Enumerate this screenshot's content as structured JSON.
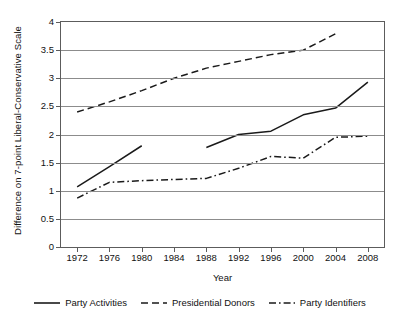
{
  "chart_data": {
    "type": "line",
    "title": "",
    "xlabel": "Year",
    "ylabel": "Difference on 7-point Liberal-Conservative Scale",
    "x": [
      1972,
      1976,
      1980,
      1984,
      1988,
      1992,
      1996,
      2000,
      2004,
      2008
    ],
    "xticklabels": [
      "1972",
      "1976",
      "1980",
      "1984",
      "1988",
      "1992",
      "1996",
      "2000",
      "2004",
      "2008"
    ],
    "yticklabels": [
      "0",
      "0.5",
      "1",
      "1.5",
      "2",
      "2.5",
      "3",
      "3.5",
      "4"
    ],
    "ytickvalues": [
      0,
      0.5,
      1,
      1.5,
      2,
      2.5,
      3,
      3.5,
      4
    ],
    "xlim": [
      1970,
      2010
    ],
    "ylim": [
      0,
      4
    ],
    "grid": "horizontal",
    "legend_position": "bottom",
    "series": [
      {
        "name": "Party Activities",
        "style": "solid",
        "color": "#1a1a1a",
        "points": [
          {
            "x": 1972,
            "y": 1.07
          },
          {
            "x": 1976,
            "y": 1.43
          },
          {
            "x": 1980,
            "y": 1.8
          },
          {
            "x": 1988,
            "y": 1.77
          },
          {
            "x": 1992,
            "y": 2.0
          },
          {
            "x": 1996,
            "y": 2.06
          },
          {
            "x": 2000,
            "y": 2.35
          },
          {
            "x": 2004,
            "y": 2.47
          },
          {
            "x": 2008,
            "y": 2.93
          }
        ],
        "gaps": [
          [
            1980,
            1988
          ]
        ]
      },
      {
        "name": "Presidential Donors",
        "style": "dashed",
        "color": "#1a1a1a",
        "points": [
          {
            "x": 1972,
            "y": 2.4
          },
          {
            "x": 1976,
            "y": 2.58
          },
          {
            "x": 1980,
            "y": 2.78
          },
          {
            "x": 1984,
            "y": 3.0
          },
          {
            "x": 1988,
            "y": 3.18
          },
          {
            "x": 1992,
            "y": 3.3
          },
          {
            "x": 1996,
            "y": 3.42
          },
          {
            "x": 2000,
            "y": 3.5
          },
          {
            "x": 2004,
            "y": 3.79
          }
        ],
        "gaps": []
      },
      {
        "name": "Party Identifiers",
        "style": "dash-dot",
        "color": "#1a1a1a",
        "points": [
          {
            "x": 1972,
            "y": 0.87
          },
          {
            "x": 1976,
            "y": 1.15
          },
          {
            "x": 1980,
            "y": 1.18
          },
          {
            "x": 1984,
            "y": 1.2
          },
          {
            "x": 1988,
            "y": 1.22
          },
          {
            "x": 1992,
            "y": 1.4
          },
          {
            "x": 1996,
            "y": 1.61
          },
          {
            "x": 2000,
            "y": 1.58
          },
          {
            "x": 2004,
            "y": 1.95
          },
          {
            "x": 2008,
            "y": 1.97
          }
        ],
        "gaps": []
      }
    ]
  },
  "legend": {
    "items": [
      {
        "label": "Party Activities",
        "style": "solid"
      },
      {
        "label": "Presidential Donors",
        "style": "dashed"
      },
      {
        "label": "Party Identifiers",
        "style": "dash-dot"
      }
    ]
  },
  "axes": {
    "x_title": "Year",
    "y_title": "Difference on 7-point Liberal-Conservative Scale"
  },
  "colors": {
    "line": "#1a1a1a",
    "grid": "#8c8c8c",
    "frame": "#5c5c5c",
    "background": "#ffffff"
  }
}
